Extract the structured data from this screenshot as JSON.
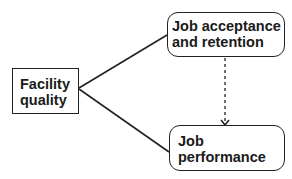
{
  "diagram": {
    "nodes": [
      {
        "id": "facility_quality",
        "shape": "rectangle",
        "lines": [
          "Facility",
          "quality"
        ]
      },
      {
        "id": "job_acceptance_retention",
        "shape": "rounded-rectangle",
        "lines": [
          "Job acceptance",
          "and retention"
        ]
      },
      {
        "id": "job_performance",
        "shape": "rounded-rectangle",
        "lines": [
          "Job",
          "performance"
        ]
      }
    ],
    "edges": [
      {
        "from": "facility_quality",
        "to": "job_acceptance_retention",
        "style": "solid",
        "arrow": false
      },
      {
        "from": "facility_quality",
        "to": "job_performance",
        "style": "solid",
        "arrow": false
      },
      {
        "from": "job_acceptance_retention",
        "to": "job_performance",
        "style": "dashed",
        "arrow": true
      }
    ],
    "colors": {
      "stroke": "#222222",
      "text": "#1a1a1a",
      "background": "#ffffff"
    }
  }
}
